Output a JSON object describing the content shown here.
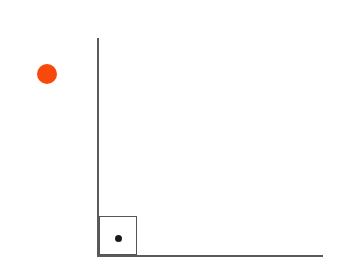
{
  "diagram": {
    "background_color": "#ffffff",
    "width": 343,
    "height": 278,
    "elements": {
      "wall": {
        "name": "vertical wall",
        "color": "#5a5a5a",
        "x": 97,
        "y_top": 38,
        "y_bottom": 257,
        "thickness": 2,
        "label": ""
      },
      "ground": {
        "name": "horizontal ground",
        "color": "#5a5a5a",
        "y": 255,
        "x_left": 97,
        "x_right": 323,
        "thickness": 2,
        "label": ""
      },
      "block": {
        "name": "square block",
        "stroke_color": "#555555",
        "fill_color": "transparent",
        "x": 99,
        "y": 216,
        "width": 38,
        "height": 39,
        "label": ""
      },
      "center_of_mass_dot": {
        "name": "center point",
        "color": "#1a1a1a",
        "cx": 118.5,
        "cy": 238.5,
        "diameter": 7,
        "label": ""
      },
      "ball": {
        "name": "orange ball",
        "color": "#f8490d",
        "cx": 47,
        "cy": 74,
        "diameter": 20,
        "label": ""
      }
    }
  }
}
